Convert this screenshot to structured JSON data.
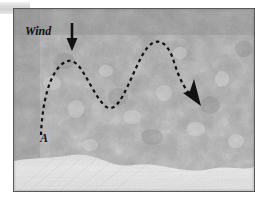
{
  "figure": {
    "caption_labels": {
      "wind": "Wind",
      "origin_point": "A"
    },
    "icons": {
      "wind_arrow": "down-arrow-icon",
      "trajectory_arrow": "arrowhead-icon"
    },
    "scene": {
      "description": "grayscale photograph of a pebbled cobblestone surface with a smooth light strip along the bottom",
      "surface_texture": "cobblestone-pebbles",
      "lower_strip": "smooth-light-sand"
    },
    "colors": {
      "frame_border": "#58595b",
      "annotation": "#111111",
      "page_background": "#ffffff",
      "margin_band": "#d2d2d2",
      "photo_mid_tone": "#9a9a9a",
      "photo_light_tone": "#e8e8e8",
      "photo_dark_tone": "#6f6f6f"
    },
    "trajectory": {
      "style": "dashed",
      "start_label": "A",
      "direction": "left-to-right",
      "path": "M 27,126 C 28,96 35,62 51,53 C 66,45 74,78 89,95 C 104,112 114,72 129,45 C 141,24 154,32 160,53 C 166,72 172,82 180,90"
    },
    "wind_arrow": {
      "x": 58,
      "y_start": 14,
      "y_end": 40
    }
  }
}
